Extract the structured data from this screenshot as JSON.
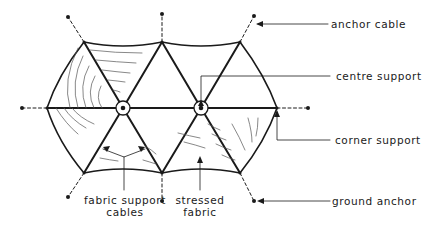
{
  "diagram": {
    "type": "plan-view",
    "labels": {
      "anchor_cable": "anchor cable",
      "centre_support": "centre support",
      "corner_support": "corner support",
      "ground_anchor": "ground anchor",
      "fabric_support_cables_line1": "fabric support",
      "fabric_support_cables_line2": "cables",
      "stressed_fabric_line1": "stressed",
      "stressed_fabric_line2": "fabric"
    },
    "colors": {
      "ink": "#1a1a1a",
      "background": "#ffffff"
    }
  }
}
